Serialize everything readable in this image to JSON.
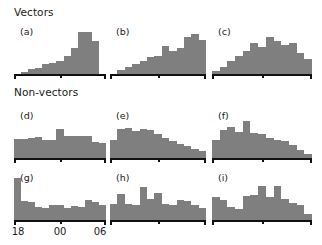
{
  "figure": {
    "groups": [
      {
        "id": "vectors",
        "label": "Vectors"
      },
      {
        "id": "non-vectors",
        "label": "Non-vectors"
      }
    ],
    "axis": {
      "tick_labels": [
        "18",
        "00",
        "06"
      ],
      "tick_positions": [
        0,
        50,
        100
      ]
    },
    "colors": {
      "bar": "#7f7f7f",
      "axis": "#111111",
      "text": "#1a1a1a",
      "background": "#ffffff"
    }
  },
  "chart_data": [
    {
      "type": "bar",
      "title": "(a)",
      "group": "Vectors",
      "xlabel": "",
      "ylabel": "",
      "categories": [
        "18",
        "19",
        "20",
        "21",
        "22",
        "23",
        "00",
        "01",
        "02",
        "03",
        "04",
        "05",
        "06"
      ],
      "tick_labels": [
        "18",
        "00",
        "06"
      ],
      "values": [
        0,
        4,
        12,
        14,
        22,
        26,
        30,
        42,
        58,
        96,
        96,
        74,
        0
      ],
      "ylim": [
        0,
        100
      ],
      "grid": false,
      "legend": "none"
    },
    {
      "type": "bar",
      "title": "(b)",
      "group": "Vectors",
      "xlabel": "",
      "ylabel": "",
      "categories": [
        "18",
        "19",
        "20",
        "21",
        "22",
        "23",
        "00",
        "01",
        "02",
        "03",
        "04",
        "05",
        "06"
      ],
      "tick_labels": [
        "18",
        "00",
        "06"
      ],
      "values": [
        0,
        8,
        16,
        22,
        30,
        38,
        40,
        64,
        52,
        58,
        84,
        92,
        78
      ],
      "ylim": [
        0,
        100
      ],
      "grid": false,
      "legend": "none"
    },
    {
      "type": "bar",
      "title": "(c)",
      "group": "Vectors",
      "xlabel": "",
      "ylabel": "",
      "categories": [
        "18",
        "19",
        "20",
        "21",
        "22",
        "23",
        "00",
        "01",
        "02",
        "03",
        "04",
        "05",
        "06"
      ],
      "tick_labels": [
        "18",
        "00",
        "06"
      ],
      "values": [
        6,
        16,
        30,
        42,
        52,
        70,
        62,
        84,
        76,
        66,
        70,
        48,
        34
      ],
      "ylim": [
        0,
        100
      ],
      "grid": false,
      "legend": "none"
    },
    {
      "type": "bar",
      "title": "(d)",
      "group": "Non-vectors",
      "xlabel": "",
      "ylabel": "",
      "categories": [
        "18",
        "19",
        "20",
        "21",
        "22",
        "23",
        "00",
        "01",
        "02",
        "03",
        "04",
        "05",
        "06"
      ],
      "tick_labels": [
        "18",
        "00",
        "06"
      ],
      "values": [
        46,
        46,
        48,
        50,
        42,
        44,
        70,
        52,
        52,
        52,
        52,
        38,
        36
      ],
      "ylim": [
        0,
        100
      ],
      "grid": false,
      "legend": "none"
    },
    {
      "type": "bar",
      "title": "(e)",
      "group": "Non-vectors",
      "xlabel": "",
      "ylabel": "",
      "categories": [
        "18",
        "19",
        "20",
        "21",
        "22",
        "23",
        "00",
        "01",
        "02",
        "03",
        "04",
        "05",
        "06"
      ],
      "tick_labels": [
        "18",
        "00",
        "06"
      ],
      "values": [
        44,
        68,
        72,
        64,
        70,
        66,
        56,
        48,
        40,
        34,
        28,
        22,
        16
      ],
      "ylim": [
        0,
        100
      ],
      "grid": false,
      "legend": "none"
    },
    {
      "type": "bar",
      "title": "(f)",
      "group": "Non-vectors",
      "xlabel": "",
      "ylabel": "",
      "categories": [
        "18",
        "19",
        "20",
        "21",
        "22",
        "23",
        "00",
        "01",
        "02",
        "03",
        "04",
        "05",
        "06"
      ],
      "tick_labels": [
        "18",
        "00",
        "06"
      ],
      "values": [
        42,
        66,
        74,
        62,
        88,
        60,
        58,
        48,
        42,
        40,
        30,
        18,
        10
      ],
      "ylim": [
        0,
        100
      ],
      "grid": false,
      "legend": "none"
    },
    {
      "type": "bar",
      "title": "(g)",
      "group": "Non-vectors",
      "xlabel": "",
      "ylabel": "",
      "categories": [
        "18",
        "19",
        "20",
        "21",
        "22",
        "23",
        "00",
        "01",
        "02",
        "03",
        "04",
        "05",
        "06"
      ],
      "tick_labels": [
        "18",
        "00",
        "06"
      ],
      "values": [
        96,
        44,
        40,
        30,
        28,
        34,
        34,
        28,
        32,
        30,
        46,
        42,
        34
      ],
      "ylim": [
        0,
        100
      ],
      "grid": false,
      "legend": "none"
    },
    {
      "type": "bar",
      "title": "(h)",
      "group": "Non-vectors",
      "xlabel": "",
      "ylabel": "",
      "categories": [
        "18",
        "19",
        "20",
        "21",
        "22",
        "23",
        "00",
        "01",
        "02",
        "03",
        "04",
        "05",
        "06"
      ],
      "tick_labels": [
        "18",
        "00",
        "06"
      ],
      "values": [
        36,
        58,
        36,
        34,
        74,
        48,
        62,
        36,
        34,
        46,
        44,
        34,
        28
      ],
      "ylim": [
        0,
        100
      ],
      "grid": false,
      "legend": "none"
    },
    {
      "type": "bar",
      "title": "(i)",
      "group": "Non-vectors",
      "xlabel": "",
      "ylabel": "",
      "categories": [
        "18",
        "19",
        "20",
        "21",
        "22",
        "23",
        "00",
        "01",
        "02",
        "03",
        "04",
        "05",
        "06"
      ],
      "tick_labels": [
        "18",
        "00",
        "06"
      ],
      "values": [
        52,
        46,
        30,
        24,
        54,
        56,
        78,
        52,
        78,
        48,
        38,
        34,
        14
      ],
      "ylim": [
        0,
        100
      ],
      "grid": false,
      "legend": "none"
    }
  ]
}
